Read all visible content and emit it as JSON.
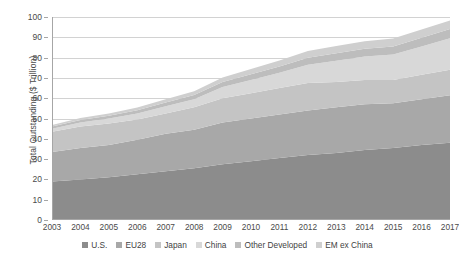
{
  "chart_data": {
    "type": "area",
    "stacked": true,
    "title": "",
    "xlabel": "",
    "ylabel": "Total Outstanding ($ Trillion)",
    "x": [
      2003,
      2004,
      2005,
      2006,
      2007,
      2008,
      2009,
      2010,
      2011,
      2012,
      2013,
      2014,
      2015,
      2016,
      2017
    ],
    "categories": [
      "2003",
      "2004",
      "2005",
      "2006",
      "2007",
      "2008",
      "2009",
      "2010",
      "2011",
      "2012",
      "2013",
      "2014",
      "2015",
      "2016",
      "2017"
    ],
    "ylim": [
      0,
      100
    ],
    "yticks": [
      0,
      10,
      20,
      30,
      40,
      50,
      60,
      70,
      80,
      90,
      100
    ],
    "ytick_labels": [
      "0",
      "10",
      "20",
      "30",
      "40",
      "50",
      "60",
      "70",
      "80",
      "90",
      "100"
    ],
    "grid": true,
    "legend_position": "bottom",
    "series": [
      {
        "name": "U.S.",
        "color": "#8c8c8c",
        "values": [
          19.0,
          20.0,
          21.0,
          22.5,
          24.0,
          25.5,
          27.5,
          29.0,
          30.5,
          32.0,
          33.0,
          34.5,
          35.5,
          37.0,
          38.0
        ]
      },
      {
        "name": "EU28",
        "color": "#a8a8a8",
        "values": [
          14.5,
          15.5,
          16.0,
          17.0,
          18.5,
          19.0,
          20.5,
          21.0,
          21.5,
          22.0,
          22.5,
          22.5,
          22.0,
          22.5,
          23.5
        ]
      },
      {
        "name": "Japan",
        "color": "#c4c4c4",
        "values": [
          10.0,
          10.5,
          10.5,
          10.0,
          10.0,
          11.0,
          12.0,
          12.5,
          13.0,
          13.5,
          12.5,
          12.0,
          11.5,
          12.0,
          12.5
        ]
      },
      {
        "name": "China",
        "color": "#d8d8d8",
        "values": [
          1.5,
          2.0,
          2.5,
          3.0,
          3.5,
          4.0,
          5.5,
          6.5,
          7.5,
          9.0,
          10.5,
          11.5,
          12.5,
          14.0,
          15.5
        ]
      },
      {
        "name": "Other Developed",
        "color": "#bdbdbd",
        "values": [
          1.0,
          1.2,
          1.4,
          1.6,
          1.9,
          2.1,
          2.5,
          2.8,
          3.1,
          3.4,
          3.6,
          3.8,
          4.0,
          4.3,
          4.6
        ]
      },
      {
        "name": "EM ex China",
        "color": "#cfcfcf",
        "values": [
          0.8,
          1.0,
          1.1,
          1.3,
          1.6,
          1.8,
          2.2,
          2.6,
          3.0,
          3.4,
          3.6,
          3.8,
          3.9,
          4.0,
          4.2
        ]
      }
    ],
    "totals": [
      46.8,
      50.2,
      52.5,
      55.4,
      59.5,
      63.4,
      70.2,
      74.4,
      78.6,
      83.3,
      85.7,
      88.1,
      89.4,
      93.8,
      98.3
    ],
    "annotations": []
  },
  "legend": {
    "items": [
      {
        "label": "U.S."
      },
      {
        "label": "EU28"
      },
      {
        "label": "Japan"
      },
      {
        "label": "China"
      },
      {
        "label": "Other Developed"
      },
      {
        "label": "EM ex China"
      }
    ]
  },
  "colors": {
    "gridline": "#d2d2d2",
    "axis": "#a6a6a6",
    "text": "#4a4a4a",
    "background": "#ffffff"
  }
}
